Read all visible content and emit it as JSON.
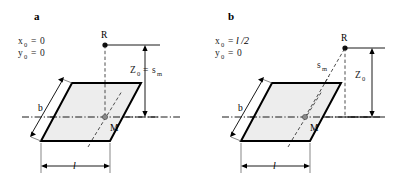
{
  "figure": {
    "background": "#ffffff",
    "plane_fill": "#ededed",
    "plane_stroke": "#000000",
    "panels": [
      {
        "id": "a",
        "label": "a",
        "conditions": [
          {
            "var": "x",
            "sub": "0",
            "eq": "=",
            "value": "0",
            "value_italic": false
          },
          {
            "var": "y",
            "sub": "0",
            "eq": "=",
            "value": "0",
            "value_italic": false
          }
        ],
        "points": [
          {
            "name": "R",
            "label": "R"
          },
          {
            "name": "M",
            "label": "M"
          }
        ],
        "height_label": {
          "var": "Z",
          "sub": "0",
          "eq": "=",
          "var2": "s",
          "sub2": "m"
        },
        "dim_length": "l",
        "dim_width": "b"
      },
      {
        "id": "b",
        "label": "b",
        "conditions": [
          {
            "var": "x",
            "sub": "0",
            "eq": "=",
            "value": "l /2",
            "value_italic": true
          },
          {
            "var": "y",
            "sub": "0",
            "eq": "=",
            "value": "0",
            "value_italic": false
          }
        ],
        "points": [
          {
            "name": "R",
            "label": "R"
          },
          {
            "name": "M",
            "label": "M"
          }
        ],
        "slant_label": {
          "var": "s",
          "sub": "m"
        },
        "height_label": {
          "var": "Z",
          "sub": "0"
        },
        "dim_length": "l",
        "dim_width": "b"
      }
    ]
  }
}
